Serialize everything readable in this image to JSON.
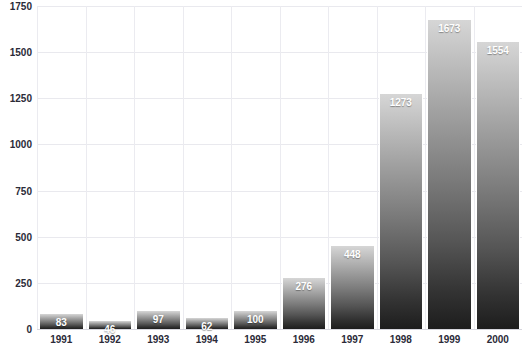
{
  "chart_data": {
    "type": "bar",
    "title": "",
    "xlabel": "",
    "ylabel": "",
    "categories": [
      "1991",
      "1992",
      "1993",
      "1994",
      "1995",
      "1996",
      "1997",
      "1998",
      "1999",
      "2000"
    ],
    "values": [
      83,
      46,
      97,
      62,
      100,
      276,
      448,
      1273,
      1673,
      1554
    ],
    "ylim": [
      0,
      1750
    ],
    "yticks": [
      0,
      250,
      500,
      750,
      1000,
      1250,
      1500,
      1750
    ],
    "ytick_labels": [
      "0",
      "250",
      "500",
      "750",
      "1000",
      "1250",
      "1500",
      "1750"
    ],
    "grid": true,
    "legend": "none",
    "bar_gradient_top": "#d6d6d6",
    "bar_gradient_bottom": "#1d1d1d",
    "value_label_color": "#ffffff",
    "gridline_color": "#e9e9ee",
    "axis_text_color": "#2b2b38",
    "background": "#ffffff"
  },
  "notes": {
    "title_cropped": "Chart title is cut off above the top edge of the screenshot"
  }
}
